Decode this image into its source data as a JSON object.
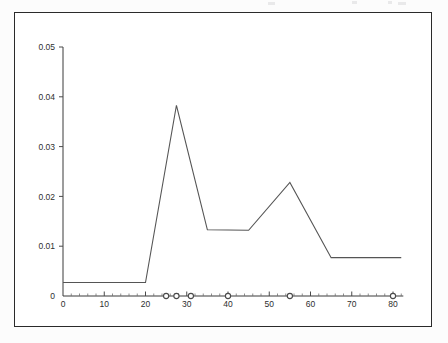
{
  "figure": {
    "background_color": "#ffffff",
    "frame_color": "#2a2a2a",
    "line_color": "#555555",
    "marker_color": "#4a4a4a"
  },
  "chart_data": {
    "type": "line",
    "title": "",
    "subtitle": "",
    "xlabel": "",
    "ylabel": "",
    "xlim": [
      0,
      82
    ],
    "ylim": [
      0,
      0.05
    ],
    "grid": false,
    "legend": null,
    "x_ticks": [
      0,
      10,
      20,
      30,
      40,
      50,
      60,
      70,
      80
    ],
    "x_tick_labels": [
      "0",
      "10",
      "20",
      "30",
      "40",
      "50",
      "60",
      "70",
      "80"
    ],
    "x_minor_tick_step": 2,
    "y_ticks": [
      0,
      0.01,
      0.02,
      0.03,
      0.04,
      0.05
    ],
    "y_tick_labels": [
      "0",
      "0.01",
      "0.02",
      "0.03",
      "0.04",
      "0.05"
    ],
    "series": [
      {
        "name": "curve",
        "style": "line",
        "x": [
          0,
          20,
          27.5,
          35,
          45,
          55,
          65,
          82
        ],
        "values": [
          0.0027,
          0.0027,
          0.0383,
          0.0133,
          0.0132,
          0.0228,
          0.0077,
          0.0077
        ]
      },
      {
        "name": "axis markers",
        "style": "open-circle-markers",
        "x": [
          25,
          27.5,
          31,
          40,
          55,
          80
        ],
        "values": [
          0,
          0,
          0,
          0,
          0,
          0
        ]
      }
    ]
  }
}
